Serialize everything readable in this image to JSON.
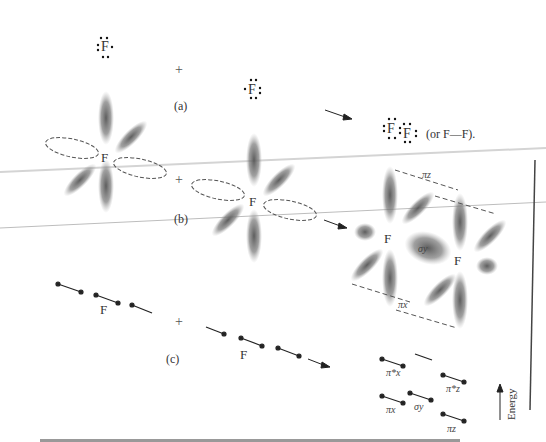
{
  "figure": {
    "parts": {
      "a": "(a)",
      "b": "(b)",
      "c": "(c)"
    },
    "plus": "+",
    "atom_label": "F",
    "lewis": {
      "f_atom": "F",
      "f2_left": "F",
      "f2_right": "F",
      "alt_text": "(or F—F)."
    },
    "orbital_labels": {
      "pi_z_top": "πz",
      "pi_x_bottom": "πx",
      "sigma_y_center": "σy",
      "pi_x_star": "π*x",
      "pi_z_star": "π*z",
      "pi_x": "πx",
      "sigma_y": "σy",
      "pi_z": "πz"
    },
    "energy_axis": "Energy",
    "caption": "Fig. 3-16  Overlapping orbitals of fluorine atoms forming F2 molecule"
  },
  "colors": {
    "lobe": "#6a6a6a",
    "dash": "#555555",
    "line": "#222222",
    "rule": "#cccccc"
  }
}
